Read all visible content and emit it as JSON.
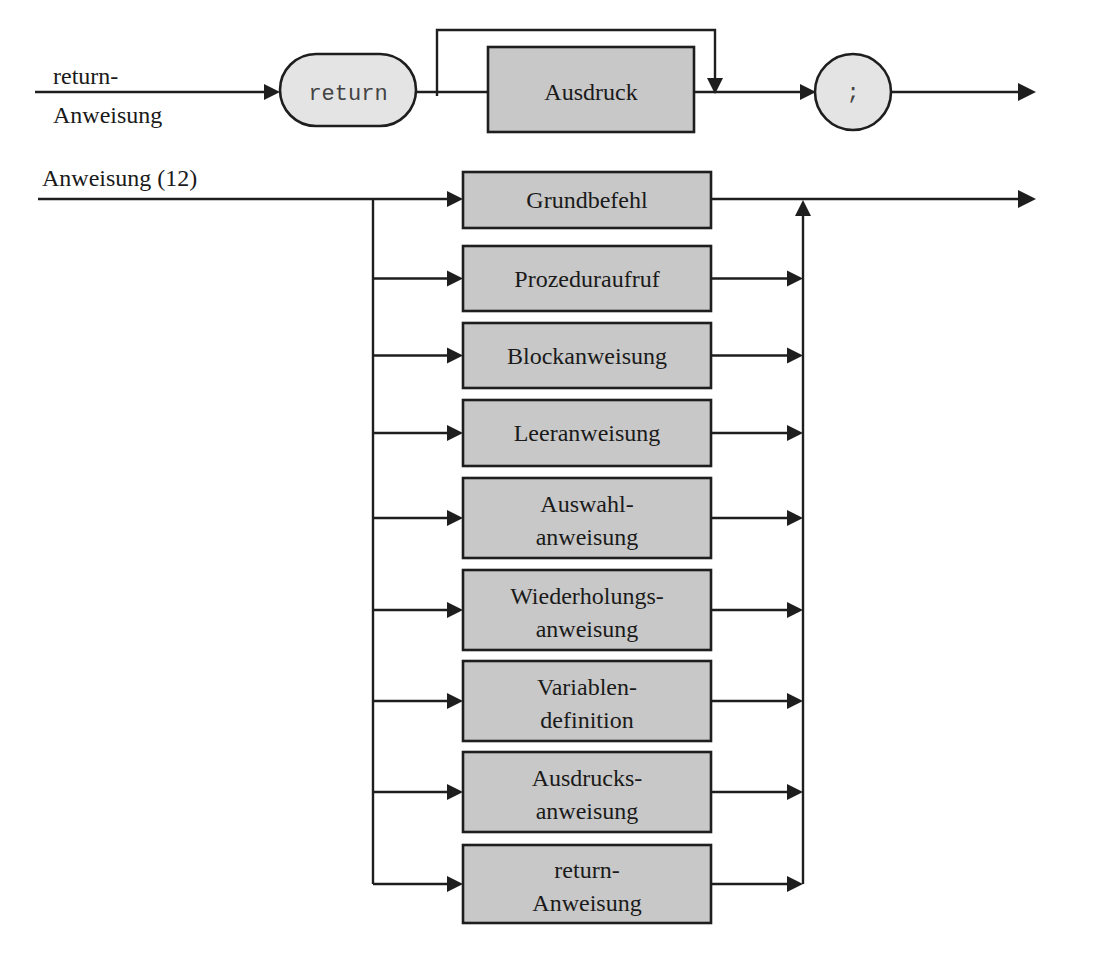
{
  "diagram": {
    "type": "syntax-diagram",
    "colors": {
      "nonterminal_fill": "#c8c8c8",
      "terminal_fill": "#e4e4e4",
      "stroke": "#1e1e1e"
    },
    "return_rule": {
      "name_line1": "return-",
      "name_line2": "Anweisung",
      "terminal_return": "return",
      "optional_nonterminal": "Ausdruck",
      "terminal_semicolon": ";"
    },
    "statement_rule": {
      "name": "Anweisung (12)",
      "alternatives": [
        {
          "line1": "Grundbefehl",
          "line2": ""
        },
        {
          "line1": "Prozeduraufruf",
          "line2": ""
        },
        {
          "line1": "Blockanweisung",
          "line2": ""
        },
        {
          "line1": "Leeranweisung",
          "line2": ""
        },
        {
          "line1": "Auswahl-",
          "line2": "anweisung"
        },
        {
          "line1": "Wiederholungs-",
          "line2": "anweisung"
        },
        {
          "line1": "Variablen-",
          "line2": "definition"
        },
        {
          "line1": "Ausdrucks-",
          "line2": "anweisung"
        },
        {
          "line1": "return-",
          "line2": "Anweisung"
        }
      ]
    }
  }
}
